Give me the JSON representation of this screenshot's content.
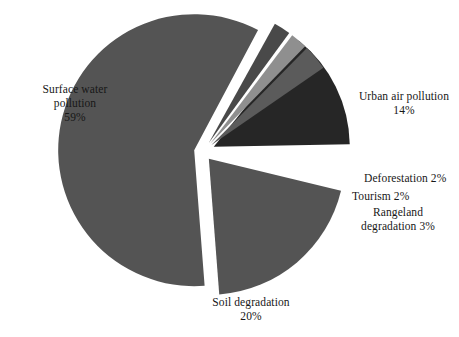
{
  "chart_data": {
    "type": "pie",
    "title": "",
    "subtitle": "",
    "xlabel": "",
    "ylabel": "",
    "legend_position": "none",
    "grid": false,
    "units": "percent",
    "total": 100,
    "center": {
      "x": 203,
      "y": 152
    },
    "radius": 136,
    "explode_gap": 9,
    "start_angle_deg": -90,
    "direction": "clockwise",
    "categories": [
      "Surface water pollution",
      "Urban air pollution",
      "Deforestation",
      "Tourism",
      "Rangeland degradation",
      "Soil degradation"
    ],
    "values": [
      59,
      14,
      2,
      2,
      3,
      20
    ],
    "value_labels": [
      "59%",
      "14%",
      "2%",
      "2%",
      "3%",
      "20%"
    ],
    "colors": [
      "#545454",
      "#262626",
      "#494949",
      "#8f8f8f",
      "#5b5b5b",
      "#545454"
    ],
    "slices": [
      {
        "name": "Surface water pollution",
        "value": 59,
        "value_label": "59%",
        "color": "#545454",
        "start_deg": 62,
        "sweep_deg": 212.4,
        "explode": 9,
        "label_line1": "Surface water",
        "label_line2": "pollution",
        "label_line3": "59%",
        "label_style": "center",
        "label_x": 10,
        "label_y": 82,
        "label_width": 130
      },
      {
        "name": "Urban air pollution",
        "value": 14,
        "value_label": "14%",
        "color": "#262626",
        "start_deg": 1.0,
        "sweep_deg": 50.4,
        "explode": 12,
        "label_line1": "Urban air pollution",
        "label_line2": "14%",
        "label_line3": "",
        "label_style": "center",
        "label_x": 348,
        "label_y": 89,
        "label_width": 112
      },
      {
        "name": "Deforestation",
        "value": 2,
        "value_label": "2%",
        "color": "#494949",
        "start_deg": 53.8,
        "sweep_deg": 7.2,
        "explode": 11,
        "label_line1": "Deforestation 2%",
        "label_line2": "",
        "label_line3": "",
        "label_style": "inline-left",
        "label_x": 364,
        "label_y": 171,
        "label_width": 100
      },
      {
        "name": "Tourism",
        "value": 2,
        "value_label": "2%",
        "color": "#8f8f8f",
        "start_deg": 45.7,
        "sweep_deg": 7.2,
        "explode": 11,
        "label_line1": "Tourism 2%",
        "label_line2": "",
        "label_line3": "",
        "label_style": "inline-left",
        "label_x": 352,
        "label_y": 189,
        "label_width": 90
      },
      {
        "name": "Rangeland degradation",
        "value": 3,
        "value_label": "3%",
        "color": "#5b5b5b",
        "start_deg": 34.6,
        "sweep_deg": 10.8,
        "explode": 11,
        "label_line1": "Rangeland",
        "label_line2": "degradation 3%",
        "label_line3": "",
        "label_style": "center",
        "label_x": 340,
        "label_y": 205,
        "label_width": 116
      },
      {
        "name": "Soil degradation",
        "value": 20,
        "value_label": "20%",
        "color": "#545454",
        "start_deg": 274.4,
        "sweep_deg": 72,
        "explode": 9,
        "label_line1": "Soil degradation",
        "label_line2": "20%",
        "label_line3": "",
        "label_style": "center",
        "label_x": 193,
        "label_y": 295,
        "label_width": 116
      }
    ]
  },
  "background_color": "#ffffff",
  "text_color": "#171717"
}
